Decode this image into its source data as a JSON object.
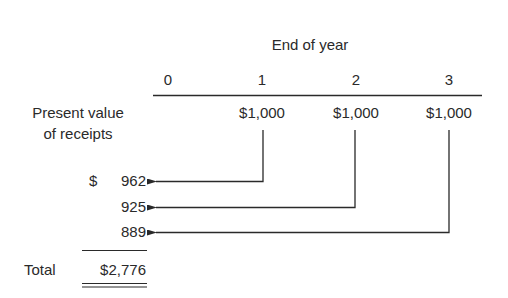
{
  "header": {
    "title": "End of year",
    "years": [
      "0",
      "1",
      "2",
      "3"
    ]
  },
  "row_label": {
    "line1": "Present value",
    "line2": "of receipts"
  },
  "receipts": [
    "$1,000",
    "$1,000",
    "$1,000"
  ],
  "present_values": {
    "currency": "$",
    "items": [
      "962",
      "925",
      "889"
    ]
  },
  "total": {
    "label": "Total",
    "value": "$2,776"
  },
  "colors": {
    "ink": "#2a2a2a",
    "background": "#ffffff"
  }
}
